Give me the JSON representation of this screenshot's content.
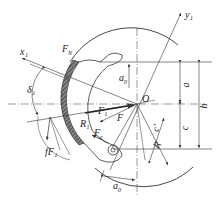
{
  "diagram": {
    "labels": {
      "x1": "x₁",
      "y1": "y₁",
      "FN": "F",
      "FN_sub": "N",
      "delta1": "δ₁",
      "fF1": "fF₁",
      "F1": "F₁",
      "F": "F",
      "R1": "R₁",
      "Fe": "F",
      "Fe_sub": "e",
      "O": "O",
      "a": "a",
      "h": "h",
      "c": "c",
      "c_prime": "c′",
      "R": "R",
      "a0_top": "a",
      "a0_top_sub": "0",
      "a0_bottom": "a",
      "a0_bottom_sub": "0"
    },
    "colors": {
      "line": "#333333",
      "hatch": "#555555",
      "background": "#ffffff"
    }
  }
}
